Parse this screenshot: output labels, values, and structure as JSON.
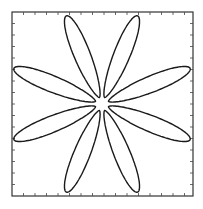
{
  "chart_data": {
    "type": "line",
    "title": "",
    "xlabel": "",
    "ylabel": "",
    "petals": 8,
    "petal_angles_deg": [
      22,
      68,
      112,
      158,
      202,
      248,
      292,
      338
    ],
    "inner_radius_px": 7,
    "outer_radius_px": 95,
    "petal_half_width_px": 9,
    "grid": false,
    "legend": null
  },
  "frame": {
    "left": 12,
    "top": 12,
    "right": 193,
    "bottom": 196,
    "tick_spacing": 11.5,
    "tick_length": 3
  },
  "center": {
    "x": 102,
    "y": 104
  },
  "colors": {
    "stroke": "#1a1a1a",
    "background": "#ffffff"
  }
}
